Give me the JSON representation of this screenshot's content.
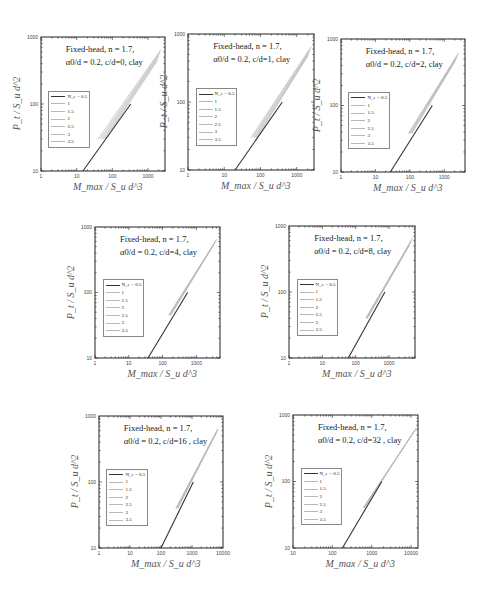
{
  "figure": {
    "xlabel": "M_max / S_u d^3",
    "ylabel": "P_t / S_u d^2",
    "legend_title": "N_e",
    "legend_entries": [
      "N_e = 0.5",
      "1",
      "1.5",
      "2",
      "2.5",
      "3",
      "3.5"
    ],
    "annotation_line1": "Fixed-head, n = 1.7,",
    "colors": {
      "dark_series": "#333333",
      "light_series": "#b8b8b8",
      "frame": "#222222"
    }
  },
  "chart_data": [
    {
      "type": "line",
      "title": "Fixed-head, n = 1.7, α0/d = 0.2, c/d=0, clay",
      "annotation_line2": "α0/d = 0.2, c/d=0, clay",
      "xscale": "log",
      "yscale": "log",
      "xlim": [
        1,
        3000
      ],
      "ylim": [
        10,
        1000
      ],
      "xticks": [
        "1",
        "10",
        "100",
        "1000"
      ],
      "yticks": [
        "10",
        "100",
        "1000"
      ],
      "xlabel": "M_max / S_u d^3",
      "ylabel": "P_t / S_u d^2",
      "legend_position": "left-middle",
      "series": [
        {
          "name": "N_e = 0.5",
          "x": [
            15,
            330
          ],
          "y": [
            10,
            100
          ]
        },
        {
          "name": "1",
          "x": [
            40,
            2300
          ],
          "y": [
            30,
            650
          ]
        },
        {
          "name": "1.5",
          "x": [
            45,
            2200
          ],
          "y": [
            30,
            600
          ]
        },
        {
          "name": "2",
          "x": [
            50,
            2100
          ],
          "y": [
            30,
            560
          ]
        },
        {
          "name": "2.5",
          "x": [
            55,
            2000
          ],
          "y": [
            30,
            520
          ]
        },
        {
          "name": "3",
          "x": [
            60,
            1900
          ],
          "y": [
            30,
            480
          ]
        },
        {
          "name": "3.5",
          "x": [
            65,
            1800
          ],
          "y": [
            30,
            440
          ]
        }
      ]
    },
    {
      "type": "line",
      "title": "Fixed-head, n = 1.7, α0/d = 0.2, c/d=1, clay",
      "annotation_line2": "α0/d = 0.2, c/d=1, clay",
      "xscale": "log",
      "yscale": "log",
      "xlim": [
        1,
        3000
      ],
      "ylim": [
        10,
        1000
      ],
      "xticks": [
        "1",
        "10",
        "100",
        "1000"
      ],
      "yticks": [
        "10",
        "100",
        "1000"
      ],
      "xlabel": "M_max / S_u d^3",
      "ylabel": "P_t / S_u d^2",
      "legend_position": "left-middle",
      "series": [
        {
          "name": "N_e = 0.5",
          "x": [
            20,
            400
          ],
          "y": [
            10,
            100
          ]
        },
        {
          "name": "1",
          "x": [
            55,
            2500
          ],
          "y": [
            30,
            650
          ]
        },
        {
          "name": "1.5",
          "x": [
            60,
            2400
          ],
          "y": [
            30,
            610
          ]
        },
        {
          "name": "2",
          "x": [
            65,
            2300
          ],
          "y": [
            30,
            570
          ]
        },
        {
          "name": "2.5",
          "x": [
            70,
            2200
          ],
          "y": [
            30,
            530
          ]
        },
        {
          "name": "3",
          "x": [
            75,
            2100
          ],
          "y": [
            30,
            500
          ]
        },
        {
          "name": "3.5",
          "x": [
            80,
            2000
          ],
          "y": [
            30,
            470
          ]
        }
      ]
    },
    {
      "type": "line",
      "title": "Fixed-head, n = 1.7, α0/d = 0.2, c/d=2, clay",
      "annotation_line2": "α0/d = 0.2, c/d=2, clay",
      "xscale": "log",
      "yscale": "log",
      "xlim": [
        1,
        4000
      ],
      "ylim": [
        10,
        1000
      ],
      "xticks": [
        "1",
        "10",
        "100",
        "1000"
      ],
      "yticks": [
        "10",
        "100",
        "1000"
      ],
      "xlabel": "M_max / S_u d^3",
      "ylabel": "P_t / S_u d^2",
      "legend_position": "left-middle",
      "series": [
        {
          "name": "N_e = 0.5",
          "x": [
            27,
            450
          ],
          "y": [
            10,
            100
          ]
        },
        {
          "name": "1",
          "x": [
            90,
            2600
          ],
          "y": [
            38,
            620
          ]
        },
        {
          "name": "1.5",
          "x": [
            95,
            2500
          ],
          "y": [
            38,
            590
          ]
        },
        {
          "name": "2",
          "x": [
            100,
            2400
          ],
          "y": [
            38,
            560
          ]
        },
        {
          "name": "2.5",
          "x": [
            105,
            2300
          ],
          "y": [
            38,
            530
          ]
        },
        {
          "name": "3",
          "x": [
            110,
            2200
          ],
          "y": [
            38,
            500
          ]
        },
        {
          "name": "3.5",
          "x": [
            115,
            2100
          ],
          "y": [
            38,
            470
          ]
        }
      ]
    },
    {
      "type": "line",
      "title": "Fixed-head, n = 1.7, α0/d = 0.2, c/d=4, clay",
      "annotation_line2": "α0/d = 0.2, c/d=4, clay",
      "xscale": "log",
      "yscale": "log",
      "xlim": [
        1,
        5000
      ],
      "ylim": [
        10,
        1000
      ],
      "xticks": [
        "1",
        "10",
        "100",
        "1000"
      ],
      "yticks": [
        "10",
        "100",
        "1000"
      ],
      "xlabel": "M_max / S_u d^3",
      "ylabel": "P_t / S_u d^2",
      "legend_position": "left-middle",
      "series": [
        {
          "name": "N_e = 0.5",
          "x": [
            37,
            550
          ],
          "y": [
            10,
            100
          ]
        },
        {
          "name": "1",
          "x": [
            150,
            4000
          ],
          "y": [
            45,
            650
          ]
        },
        {
          "name": "1.5",
          "x": [
            155,
            3800
          ],
          "y": [
            45,
            620
          ]
        },
        {
          "name": "2",
          "x": [
            160,
            3600
          ],
          "y": [
            45,
            590
          ]
        },
        {
          "name": "2.5",
          "x": [
            165,
            3400
          ],
          "y": [
            45,
            560
          ]
        },
        {
          "name": "3",
          "x": [
            170,
            3200
          ],
          "y": [
            45,
            530
          ]
        },
        {
          "name": "3.5",
          "x": [
            175,
            3000
          ],
          "y": [
            45,
            500
          ]
        }
      ]
    },
    {
      "type": "line",
      "title": "Fixed-head, n = 1.7, α0/d = 0.2, c/d=8, clay",
      "annotation_line2": "α0/d = 0.2, c/d=8, clay",
      "xscale": "log",
      "yscale": "log",
      "xlim": [
        1,
        6000
      ],
      "ylim": [
        10,
        1000
      ],
      "xticks": [
        "1",
        "10",
        "100",
        "1000"
      ],
      "yticks": [
        "10",
        "100",
        "1000"
      ],
      "xlabel": "M_max / S_u d^3",
      "ylabel": "P_t / S_u d^2",
      "legend_position": "left-middle",
      "series": [
        {
          "name": "N_e = 0.5",
          "x": [
            60,
            750
          ],
          "y": [
            10,
            100
          ]
        },
        {
          "name": "1",
          "x": [
            200,
            5000
          ],
          "y": [
            40,
            650
          ]
        },
        {
          "name": "1.5",
          "x": [
            205,
            4800
          ],
          "y": [
            40,
            620
          ]
        },
        {
          "name": "2",
          "x": [
            210,
            4600
          ],
          "y": [
            40,
            590
          ]
        },
        {
          "name": "2.5",
          "x": [
            215,
            4400
          ],
          "y": [
            40,
            560
          ]
        },
        {
          "name": "3",
          "x": [
            220,
            4200
          ],
          "y": [
            40,
            530
          ]
        },
        {
          "name": "3.5",
          "x": [
            225,
            4000
          ],
          "y": [
            40,
            500
          ]
        }
      ]
    },
    {
      "type": "line",
      "title": "Fixed-head, n = 1.7, α0/d = 0.2, c/d=16 , clay",
      "annotation_line2": "α0/d = 0.2, c/d=16 , clay",
      "xscale": "log",
      "yscale": "log",
      "xlim": [
        1,
        10000
      ],
      "ylim": [
        10,
        1000
      ],
      "xticks": [
        "1",
        "10",
        "100",
        "1000",
        "10000"
      ],
      "yticks": [
        "10",
        "100",
        "1000"
      ],
      "xlabel": "M_max / S_u d^3",
      "ylabel": "P_t / S_u d^2",
      "legend_position": "left-middle",
      "series": [
        {
          "name": "N_e = 0.5",
          "x": [
            100,
            1100
          ],
          "y": [
            10,
            100
          ]
        },
        {
          "name": "1",
          "x": [
            300,
            7000
          ],
          "y": [
            40,
            650
          ]
        },
        {
          "name": "1.5",
          "x": [
            310,
            6800
          ],
          "y": [
            40,
            630
          ]
        },
        {
          "name": "2",
          "x": [
            320,
            6600
          ],
          "y": [
            40,
            610
          ]
        },
        {
          "name": "2.5",
          "x": [
            330,
            6400
          ],
          "y": [
            40,
            590
          ]
        },
        {
          "name": "3",
          "x": [
            340,
            6200
          ],
          "y": [
            40,
            570
          ]
        },
        {
          "name": "3.5",
          "x": [
            350,
            6000
          ],
          "y": [
            40,
            550
          ]
        }
      ]
    },
    {
      "type": "line",
      "title": "Fixed-head, n = 1.7, α0/d = 0.2, c/d=32 , clay",
      "annotation_line2": "α0/d = 0.2, c/d=32 , clay",
      "xscale": "log",
      "yscale": "log",
      "xlim": [
        10,
        15000
      ],
      "ylim": [
        10,
        1000
      ],
      "xticks": [
        "10",
        "100",
        "1000",
        "10000"
      ],
      "yticks": [
        "10",
        "100",
        "1000"
      ],
      "xlabel": "M_max / S_u d^3",
      "ylabel": "P_t / S_u d^2",
      "legend_position": "left-middle",
      "series": [
        {
          "name": "N_e = 0.5",
          "x": [
            180,
            1800
          ],
          "y": [
            10,
            100
          ]
        },
        {
          "name": "1",
          "x": [
            600,
            14000
          ],
          "y": [
            40,
            650
          ]
        },
        {
          "name": "1.5",
          "x": [
            610,
            13500
          ],
          "y": [
            40,
            630
          ]
        },
        {
          "name": "2",
          "x": [
            620,
            13000
          ],
          "y": [
            40,
            610
          ]
        },
        {
          "name": "2.5",
          "x": [
            630,
            12500
          ],
          "y": [
            40,
            590
          ]
        },
        {
          "name": "3",
          "x": [
            640,
            12000
          ],
          "y": [
            40,
            570
          ]
        },
        {
          "name": "3.5",
          "x": [
            650,
            11500
          ],
          "y": [
            40,
            550
          ]
        }
      ]
    }
  ],
  "layout": [
    {
      "left": 41,
      "top": 37,
      "right": 165,
      "bottom": 171
    },
    {
      "left": 188,
      "top": 34,
      "right": 314,
      "bottom": 170
    },
    {
      "left": 341,
      "top": 39,
      "right": 465,
      "bottom": 172
    },
    {
      "left": 95,
      "top": 227,
      "right": 220,
      "bottom": 358
    },
    {
      "left": 289,
      "top": 226,
      "right": 415,
      "bottom": 358
    },
    {
      "left": 99,
      "top": 416,
      "right": 223,
      "bottom": 548
    },
    {
      "left": 293,
      "top": 415,
      "right": 418,
      "bottom": 548
    }
  ]
}
